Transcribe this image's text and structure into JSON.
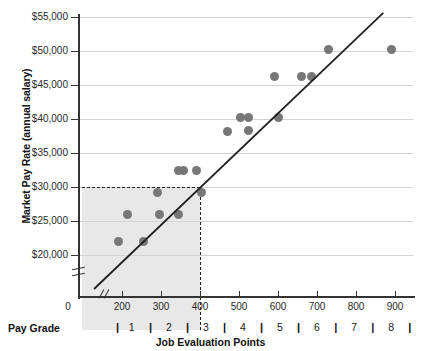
{
  "chart_data": {
    "type": "scatter",
    "title": "",
    "xlabel": "Job Evaluation Points",
    "ylabel": "Market Pay Rate (annual salary)",
    "xlim": [
      0,
      950
    ],
    "ylim": [
      15000,
      55000
    ],
    "xticks": [
      0,
      200,
      300,
      400,
      500,
      600,
      700,
      800,
      900
    ],
    "xtick_labels": [
      "0",
      "200",
      "300",
      "400",
      "500",
      "600",
      "700",
      "800",
      "900"
    ],
    "yticks": [
      20000,
      25000,
      30000,
      35000,
      40000,
      45000,
      50000,
      55000
    ],
    "ytick_labels": [
      "$20,000",
      "$25,000",
      "$30,000",
      "$35,000",
      "$40,000",
      "$45,000",
      "$50,000",
      "$55,000"
    ],
    "grid": "horizontal",
    "legend": "none",
    "axis_break_x": true,
    "axis_break_y": true,
    "marker_color": "#777777",
    "trendline_color": "#222222",
    "shade_color": "#e7e7e7",
    "points": [
      {
        "x": 180,
        "y": 22000
      },
      {
        "x": 215,
        "y": 26000
      },
      {
        "x": 255,
        "y": 22000
      },
      {
        "x": 290,
        "y": 29200
      },
      {
        "x": 295,
        "y": 26000
      },
      {
        "x": 345,
        "y": 26000
      },
      {
        "x": 345,
        "y": 32500
      },
      {
        "x": 357,
        "y": 32500
      },
      {
        "x": 392,
        "y": 32500
      },
      {
        "x": 403,
        "y": 29200
      },
      {
        "x": 470,
        "y": 38200
      },
      {
        "x": 505,
        "y": 40200
      },
      {
        "x": 525,
        "y": 40200
      },
      {
        "x": 525,
        "y": 38300
      },
      {
        "x": 590,
        "y": 46200
      },
      {
        "x": 600,
        "y": 40200
      },
      {
        "x": 660,
        "y": 46200
      },
      {
        "x": 685,
        "y": 46200
      },
      {
        "x": 730,
        "y": 50200
      },
      {
        "x": 890,
        "y": 50200
      }
    ],
    "trendline": {
      "x1": 60,
      "y1": 15000,
      "x2": 870,
      "y2": 55600
    },
    "shaded_region": {
      "x1": 0,
      "y1": 15000,
      "x2": 400,
      "y2": 30000
    },
    "guide_lines": {
      "horizontal_value": 30000,
      "vertical_value": 400
    },
    "pay_grade_axis": {
      "label": "Pay Grade",
      "grades": [
        "1",
        "2",
        "3",
        "4",
        "5",
        "6",
        "7",
        "8"
      ],
      "separator": "|",
      "grade_centers": [
        225,
        320,
        415,
        510,
        605,
        700,
        795,
        890
      ],
      "separator_positions": [
        178,
        273,
        368,
        463,
        558,
        653,
        748,
        843,
        938
      ]
    }
  }
}
